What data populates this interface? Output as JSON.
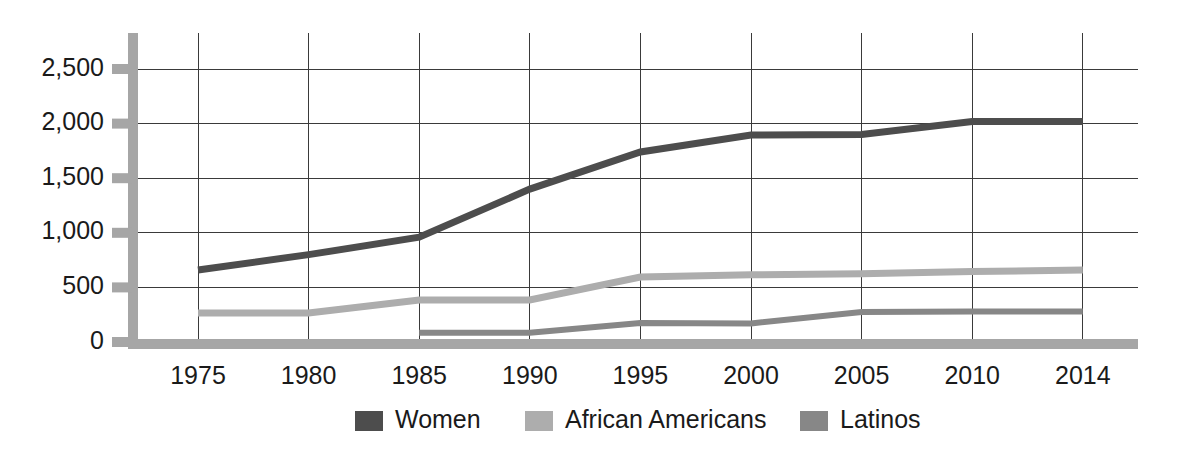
{
  "chart_data": {
    "type": "line",
    "title": "",
    "subtitle": "",
    "xlabel": "",
    "ylabel": "",
    "x": [
      1975,
      1980,
      1985,
      1990,
      1995,
      2000,
      2005,
      2010,
      2014
    ],
    "categories": [
      "1975",
      "1980",
      "1985",
      "1990",
      "1995",
      "2000",
      "2005",
      "2010",
      "2014"
    ],
    "xtick_labels": [
      "1975",
      "1980",
      "1985",
      "1990",
      "1995",
      "2000",
      "2005",
      "2010",
      "2014"
    ],
    "ytick_labels": [
      "2,500",
      "2,000",
      "1,500",
      "1,000",
      "500",
      "0"
    ],
    "yticks": [
      2500,
      2000,
      1500,
      1000,
      500,
      0
    ],
    "ylim": [
      0,
      2650
    ],
    "xlim": [
      1972,
      2017
    ],
    "grid": true,
    "legend_position": "bottom",
    "series": [
      {
        "name": "Women",
        "color": "#4d4d4d",
        "values": [
          660,
          800,
          960,
          1400,
          1740,
          1895,
          1900,
          2020,
          2020
        ]
      },
      {
        "name": "African Americans",
        "color": "#adadad",
        "values": [
          265,
          265,
          385,
          385,
          595,
          615,
          625,
          645,
          660
        ]
      },
      {
        "name": "Latinos",
        "color": "#878787",
        "values": [
          null,
          null,
          85,
          85,
          175,
          170,
          275,
          280,
          280
        ]
      }
    ],
    "legend": [
      {
        "label": "Women",
        "color": "#4d4d4d"
      },
      {
        "label": "African Americans",
        "color": "#adadad"
      },
      {
        "label": "Latinos",
        "color": "#878787"
      }
    ]
  },
  "axes": {
    "y_axis_name": "value-axis",
    "x_axis_name": "year-axis"
  }
}
